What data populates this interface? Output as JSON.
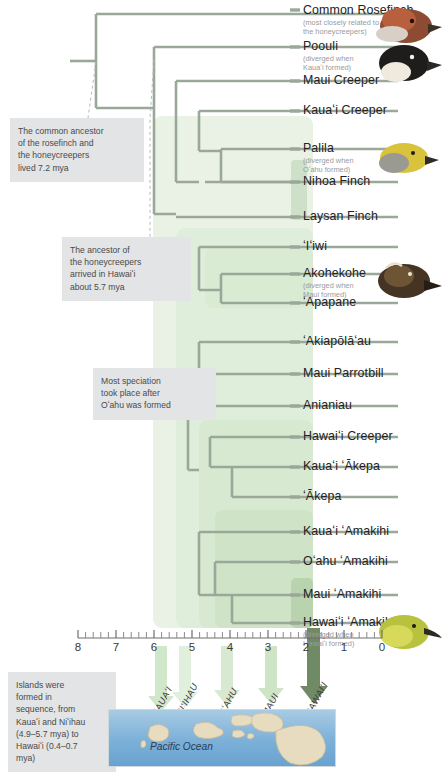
{
  "figure": {
    "axis_label": "million years ago (mya)"
  },
  "colors": {
    "branch": "#9aa89a",
    "clade_fill_light": "#eef4ec",
    "clade_fill_mid": "#dcead7",
    "clade_fill_deep": "#c7dcc0",
    "note_bg": "#e2e4e6",
    "note_text": "#4a4a4a",
    "ocean": "#7cb0d8",
    "island": "#e8dcc0",
    "arrow_green": "#bcdcb4",
    "arrow_dark": "#5f7d53"
  },
  "tips": [
    {
      "name": "Common Rosefinch",
      "sub": [
        "(most closely related to",
        "the honeycreepers)"
      ],
      "y": 4,
      "tick_y": 10
    },
    {
      "name": "Poouli",
      "sub": [
        "(diverged when",
        "Kauaʻi formed)"
      ],
      "y": 41,
      "tick_y": 47
    },
    {
      "name": "Maui Creeper",
      "sub": [],
      "y": 75,
      "tick_y": 81
    },
    {
      "name": "Kauaʻi Creeper",
      "sub": [],
      "y": 105,
      "tick_y": 111
    },
    {
      "name": "Palila",
      "sub": [
        "(diverged when",
        "Oʻahu formed)"
      ],
      "y": 143,
      "tick_y": 149
    },
    {
      "name": "Nihoa Finch",
      "sub": [],
      "y": 176,
      "tick_y": 182
    },
    {
      "name": "Laysan Finch",
      "sub": [],
      "y": 211,
      "tick_y": 217
    },
    {
      "name": "ʻIʻiwi",
      "sub": [],
      "y": 241,
      "tick_y": 247
    },
    {
      "name": "Akohekohe",
      "sub": [
        "(diverged when",
        "Maui formed)"
      ],
      "y": 268,
      "tick_y": 274
    },
    {
      "name": "ʻApapane",
      "sub": [],
      "y": 297,
      "tick_y": 303
    },
    {
      "name": "ʻAkiapōlāʻau",
      "sub": [],
      "y": 336,
      "tick_y": 342
    },
    {
      "name": "Maui Parrotbill",
      "sub": [],
      "y": 368,
      "tick_y": 374
    },
    {
      "name": "Anianiau",
      "sub": [],
      "y": 400,
      "tick_y": 406
    },
    {
      "name": "Hawaiʻi Creeper",
      "sub": [],
      "y": 431,
      "tick_y": 437
    },
    {
      "name": "Kauaʻi ʻĀkepa",
      "sub": [],
      "y": 461,
      "tick_y": 467
    },
    {
      "name": "ʻĀkepa",
      "sub": [],
      "y": 491,
      "tick_y": 497
    },
    {
      "name": "Kauaʻi ʻAmakihi",
      "sub": [],
      "y": 526,
      "tick_y": 532
    },
    {
      "name": "Oʻahu ʻAmakihi",
      "sub": [],
      "y": 556,
      "tick_y": 562
    },
    {
      "name": "Maui ʻAmakihi",
      "sub": [],
      "y": 589,
      "tick_y": 595
    },
    {
      "name": "Hawaiʻi ʻAmakihi",
      "sub": [
        "(diverged when",
        "Hawaiʻi formed)"
      ],
      "y": 617,
      "tick_y": 623
    }
  ],
  "notes": [
    {
      "id": "note-rosefinch-ancestor",
      "lines": [
        "The common ancestor",
        "of the rosefinch and",
        "the honeycreepers",
        "lived 7.2 mya"
      ],
      "x": 10,
      "y": 118,
      "w": 118
    },
    {
      "id": "note-arrival",
      "lines": [
        "The ancestor of",
        "the honeycreepers",
        "arrived in Hawaiʻi",
        "about 5.7 mya"
      ],
      "x": 62,
      "y": 237,
      "w": 113
    },
    {
      "id": "note-speciation",
      "lines": [
        "Most speciation",
        "took place after",
        "Oʻahu was formed"
      ],
      "x": 93,
      "y": 368,
      "w": 107
    },
    {
      "id": "note-islands",
      "lines": [
        "Islands were",
        "formed in",
        "sequence, from",
        "Kauaʻi and Niʻihau",
        "(4.9–5.7 mya) to",
        "Hawaiʻi (0.4–0.7",
        "mya)"
      ],
      "x": 8,
      "y": 672,
      "w": 92
    }
  ],
  "axis": {
    "ticks": [
      "8",
      "7",
      "6",
      "5",
      "4",
      "3",
      "2",
      "1",
      "0"
    ],
    "x_px": [
      78,
      116,
      154,
      192,
      230,
      268,
      306,
      344,
      382
    ],
    "minor_between": 4
  },
  "islands": [
    {
      "label": "KAUAʻI",
      "x": 166,
      "arrow_x": 160,
      "arrow_dark": false
    },
    {
      "label": "NIʻIHAU",
      "x": 190,
      "arrow_x": 184,
      "arrow_dark": false
    },
    {
      "label": "OʻAHU",
      "x": 232,
      "arrow_x": 226,
      "arrow_dark": false
    },
    {
      "label": "MAUI",
      "x": 276,
      "arrow_x": 270,
      "arrow_dark": false
    },
    {
      "label": "HAWAIʻI",
      "x": 320,
      "arrow_x": 313,
      "arrow_dark": true
    }
  ],
  "ocean": {
    "label": "Pacific Ocean"
  },
  "birds": [
    {
      "id": "bird-common-rosefinch",
      "x": 378,
      "y": 6,
      "w": 64,
      "h": 40
    },
    {
      "id": "bird-poouli",
      "x": 376,
      "y": 42,
      "w": 64,
      "h": 42
    },
    {
      "id": "bird-palila",
      "x": 380,
      "y": 140,
      "w": 60,
      "h": 38
    },
    {
      "id": "bird-akohekohe",
      "x": 378,
      "y": 262,
      "w": 64,
      "h": 42
    },
    {
      "id": "bird-hawaii-amakihi",
      "x": 378,
      "y": 610,
      "w": 66,
      "h": 44
    }
  ]
}
